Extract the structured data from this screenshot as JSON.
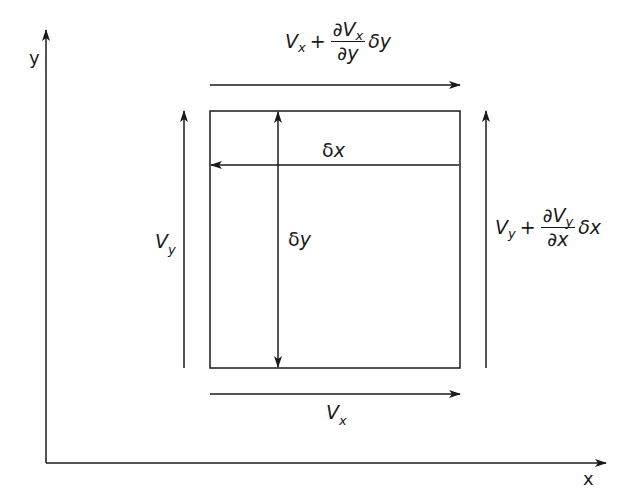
{
  "diagram": {
    "type": "fluid element flow diagram",
    "axes": {
      "x_label": "x",
      "y_label": "y"
    },
    "element": {
      "width_label": {
        "main": "δ",
        "var": "x"
      },
      "height_label": {
        "main": "δ",
        "var": "y"
      }
    },
    "flows": {
      "left": {
        "V": "V",
        "sub": "y"
      },
      "bottom": {
        "V": "V",
        "sub": "x"
      },
      "top": {
        "V": "V",
        "sub": "x",
        "plus": "+",
        "num_d": "∂",
        "num_V": "V",
        "num_sub": "x",
        "den": "∂y",
        "delta": "δy"
      },
      "right": {
        "V": "V",
        "sub": "y",
        "plus": "+",
        "num_d": "∂",
        "num_V": "V",
        "num_sub": "y",
        "den": "∂x",
        "delta": "δx"
      }
    },
    "colors": {
      "line": "#1a1a1a",
      "background": "#ffffff"
    }
  }
}
